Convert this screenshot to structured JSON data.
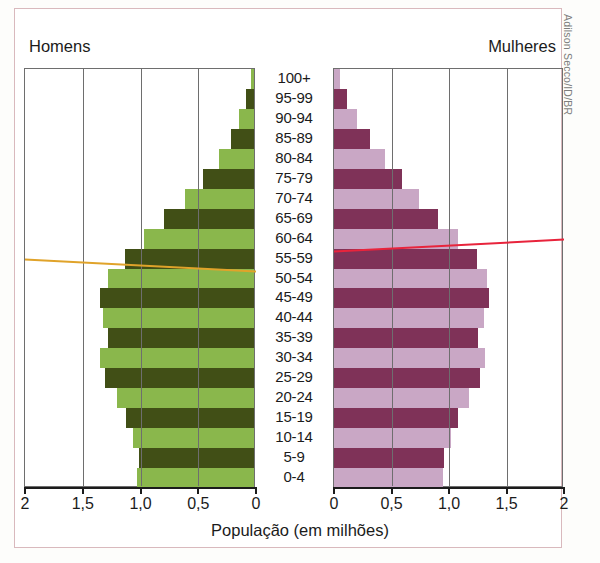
{
  "figure": {
    "credit": "Adilson Secco/ID/BR",
    "male_caption": "Homens",
    "female_caption": "Mulheres"
  },
  "chart_data": {
    "type": "bar",
    "subtype": "population-pyramid",
    "title": "",
    "xlabel": "População (em milhões)",
    "ylabel": "",
    "grid": true,
    "legend_position": "top",
    "xlim_left": [
      2,
      0
    ],
    "xlim_right": [
      0,
      2
    ],
    "xticks_left": [
      "2",
      "1,5",
      "1,0",
      "0,5",
      "0"
    ],
    "xticks_right": [
      "0",
      "0,5",
      "1,0",
      "1,5",
      "2"
    ],
    "xtick_values_left": [
      2,
      1.5,
      1.0,
      0.5,
      0
    ],
    "xtick_values_right": [
      0,
      0.5,
      1.0,
      1.5,
      2
    ],
    "categories": [
      "100+",
      "95-99",
      "90-94",
      "85-89",
      "80-84",
      "75-79",
      "70-74",
      "65-69",
      "60-64",
      "55-59",
      "50-54",
      "45-49",
      "40-44",
      "35-39",
      "30-34",
      "25-29",
      "20-24",
      "15-19",
      "10-14",
      "5-9",
      "0-4"
    ],
    "series": [
      {
        "name": "Homens",
        "side": "left",
        "color_light": "#8ab74c",
        "color_dark": "#414f16",
        "values": [
          0.03,
          0.07,
          0.13,
          0.2,
          0.3,
          0.44,
          0.6,
          0.78,
          0.95,
          1.12,
          1.26,
          1.33,
          1.31,
          1.26,
          1.33,
          1.29,
          1.19,
          1.11,
          1.05,
          1.0,
          1.01
        ]
      },
      {
        "name": "Mulheres",
        "side": "right",
        "color_light": "#c9a7c5",
        "color_dark": "#7f3258",
        "values": [
          0.05,
          0.11,
          0.2,
          0.31,
          0.44,
          0.59,
          0.74,
          0.9,
          1.08,
          1.24,
          1.33,
          1.35,
          1.3,
          1.25,
          1.31,
          1.27,
          1.17,
          1.08,
          1.02,
          0.96,
          0.95
        ]
      }
    ],
    "annotations": [
      {
        "name": "male-trend-line",
        "color": "#e0a32a",
        "at_category": "55-59"
      },
      {
        "name": "female-trend-line",
        "color": "#e8243c",
        "at_category": "60-64"
      }
    ]
  }
}
